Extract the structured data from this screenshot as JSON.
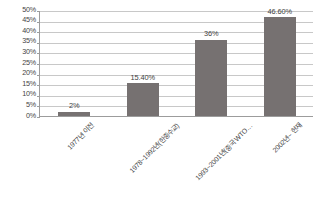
{
  "chart_data": {
    "type": "bar",
    "title": "",
    "xlabel": "",
    "ylabel": "",
    "categories": [
      "1977년 이전",
      "1978~1992년(한중수교)",
      "1993~2001년(중국 WTO…",
      "2002년~ 현재"
    ],
    "values": [
      2,
      15.4,
      36,
      46.6
    ],
    "data_labels": [
      "2%",
      "15.40%",
      "36%",
      "46.60%"
    ],
    "ylim": [
      0,
      50
    ],
    "y_tick_labels": [
      "50%",
      "45%",
      "40%",
      "35%",
      "30%",
      "25%",
      "20%",
      "15%",
      "10%",
      "5%",
      "0%"
    ],
    "y_tick_values": [
      50,
      45,
      40,
      35,
      30,
      25,
      20,
      15,
      10,
      5,
      0
    ],
    "grid": true,
    "legend": false,
    "legend_position": "none",
    "series": [
      {
        "name": "",
        "values": [
          2,
          15.4,
          36,
          46.6
        ]
      }
    ],
    "colors": {
      "bar_fill": "#767171",
      "gridline": "#c8c8c8",
      "axis_line": "#9c9c9c",
      "text": "#3f3f3f",
      "background": "#ffffff"
    }
  }
}
